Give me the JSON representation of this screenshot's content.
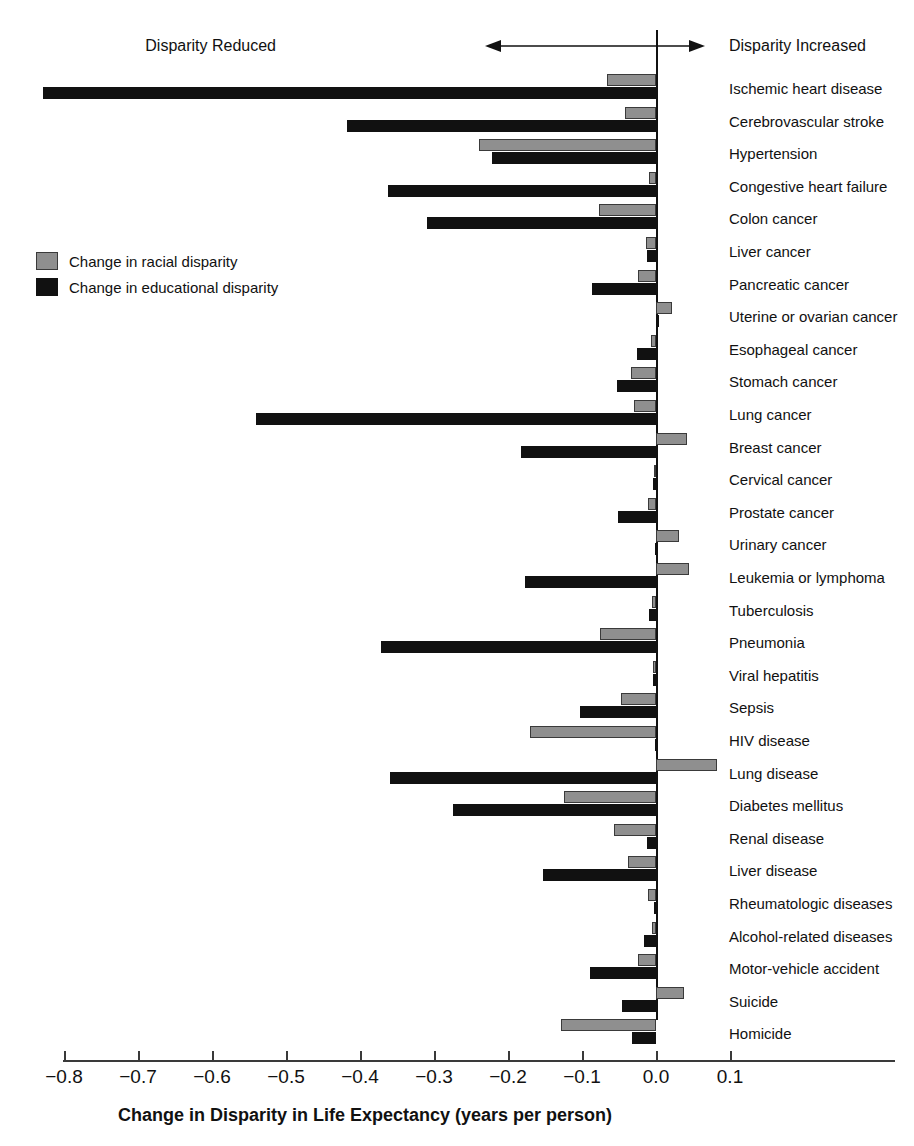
{
  "annotations": {
    "left_label": "Disparity Reduced",
    "right_label": "Disparity Increased",
    "arrow_left_icon": "arrow-left-icon",
    "arrow_right_icon": "arrow-right-icon"
  },
  "legend": {
    "position": "upper-left",
    "items": [
      {
        "label": "Change in racial disparity",
        "color": "#8f8f8f",
        "key": "racial"
      },
      {
        "label": "Change in educational disparity",
        "color": "#111111",
        "key": "educational"
      }
    ]
  },
  "chart_data": {
    "type": "bar",
    "orientation": "horizontal",
    "title": "",
    "xlabel": "Change in Disparity in Life Expectancy (years per person)",
    "ylabel": "",
    "xlim": [
      -0.85,
      0.13
    ],
    "xticks": [
      -0.8,
      -0.7,
      -0.6,
      -0.5,
      -0.4,
      -0.3,
      -0.2,
      -0.1,
      0.0,
      0.1
    ],
    "xtick_labels": [
      "−0.8",
      "−0.7",
      "−0.6",
      "−0.5",
      "−0.4",
      "−0.3",
      "−0.2",
      "−0.1",
      "0.0",
      "0.1"
    ],
    "grid": false,
    "zero_reference_line": 0.0,
    "legend_position": "upper-left",
    "categories": [
      "Ischemic heart disease",
      "Cerebrovascular stroke",
      "Hypertension",
      "Congestive heart failure",
      "Colon cancer",
      "Liver cancer",
      "Pancreatic cancer",
      "Uterine or ovarian cancer",
      "Esophageal cancer",
      "Stomach cancer",
      "Lung cancer",
      "Breast cancer",
      "Cervical cancer",
      "Prostate cancer",
      "Urinary cancer",
      "Leukemia or lymphoma",
      "Tuberculosis",
      "Pneumonia",
      "Viral hepatitis",
      "Sepsis",
      "HIV disease",
      "Lung disease",
      "Diabetes mellitus",
      "Renal disease",
      "Liver disease",
      "Rheumatologic diseases",
      "Alcohol-related diseases",
      "Motor-vehicle accident",
      "Suicide",
      "Homicide"
    ],
    "series": [
      {
        "name": "Change in racial disparity",
        "color": "#8f8f8f",
        "values": [
          -0.066,
          -0.042,
          -0.239,
          -0.009,
          -0.077,
          -0.014,
          -0.024,
          0.021,
          -0.007,
          -0.034,
          -0.03,
          0.042,
          -0.003,
          -0.011,
          0.031,
          0.045,
          -0.006,
          -0.076,
          -0.004,
          -0.047,
          -0.17,
          0.082,
          -0.124,
          -0.057,
          -0.038,
          -0.011,
          -0.005,
          -0.025,
          0.038,
          -0.128
        ]
      },
      {
        "name": "Change in educational disparity",
        "color": "#111111",
        "values": [
          -0.828,
          -0.418,
          -0.222,
          -0.362,
          -0.31,
          -0.012,
          -0.087,
          0.0,
          -0.026,
          -0.053,
          -0.54,
          -0.183,
          -0.004,
          -0.052,
          -0.002,
          -0.177,
          -0.01,
          -0.372,
          -0.004,
          -0.103,
          -0.002,
          -0.36,
          -0.275,
          -0.012,
          -0.153,
          -0.003,
          -0.016,
          -0.089,
          -0.046,
          -0.033
        ]
      }
    ]
  }
}
